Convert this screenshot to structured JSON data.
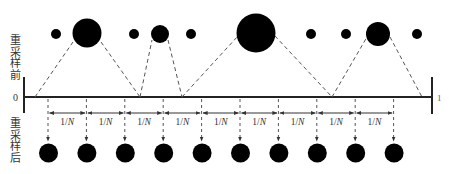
{
  "labels": {
    "before": "重采样前",
    "after": "重采样后",
    "axis_start": "0",
    "axis_end": "1",
    "interval": "1/N",
    "interval_numerator": "1/",
    "interval_denominator": "N"
  },
  "colors": {
    "ink": "#000000",
    "line": "#333333",
    "dash": "#555555",
    "text": "#333333"
  },
  "before_samples": [
    {
      "weight_class": "small"
    },
    {
      "weight_class": "large"
    },
    {
      "weight_class": "small"
    },
    {
      "weight_class": "medium"
    },
    {
      "weight_class": "small"
    },
    {
      "weight_class": "largest"
    },
    {
      "weight_class": "small"
    },
    {
      "weight_class": "small"
    },
    {
      "weight_class": "medium"
    },
    {
      "weight_class": "small"
    }
  ],
  "after_samples_count": 10,
  "interval_count": 9
}
